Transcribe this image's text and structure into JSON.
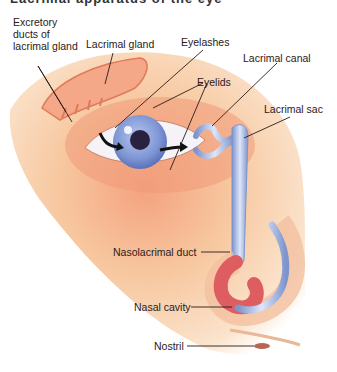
{
  "diagram": {
    "title_clipped": "Lacrimal apparatus of the eye",
    "labels": {
      "excretory_ducts": "Excretory ducts of lacrimal gland",
      "lacrimal_gland": "Lacrimal gland",
      "eyelashes": "Eyelashes",
      "lacrimal_canal": "Lacrimal canal",
      "eyelids": "Eyelids",
      "lacrimal_sac": "Lacrimal sac",
      "nasolacrimal_duct": "Nasolacrimal duct",
      "nasal_cavity": "Nasal cavity",
      "nostril": "Nostril"
    },
    "colors": {
      "skin": "#f6c9a0",
      "gland": "#f0a27c",
      "iris": "#8fa6dc",
      "duct": "#b9c8ec",
      "nasal": "#e06a6a",
      "leader": "#2a1a1a"
    }
  }
}
